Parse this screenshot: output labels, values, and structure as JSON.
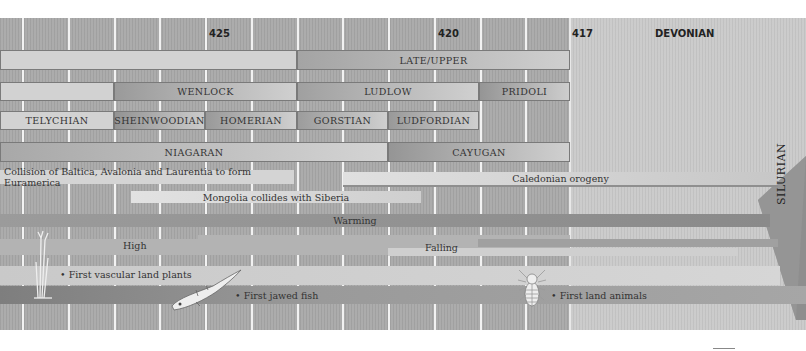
{
  "axis": {
    "ticks": [
      {
        "label": "425",
        "x": 209
      },
      {
        "label": "420",
        "x": 438
      },
      {
        "label": "417",
        "x": 572
      }
    ],
    "gridlines_x": [
      22,
      68,
      114,
      159,
      205,
      251,
      297,
      342,
      388,
      434,
      480,
      525,
      570
    ]
  },
  "periods": {
    "next": "DEVONIAN",
    "current": "SILURIAN"
  },
  "epochs_row1": [
    {
      "label": "",
      "x": 0,
      "w": 297,
      "tone": "light"
    },
    {
      "label": "LATE/UPPER",
      "x": 297,
      "w": 273,
      "tone": "mid"
    }
  ],
  "epochs_row2": [
    {
      "label": "",
      "x": 0,
      "w": 114,
      "tone": "light"
    },
    {
      "label": "WENLOCK",
      "x": 114,
      "w": 183,
      "tone": "mid"
    },
    {
      "label": "LUDLOW",
      "x": 297,
      "w": 182,
      "tone": "mid"
    },
    {
      "label": "PRIDOLI",
      "x": 479,
      "w": 91,
      "tone": "dark"
    }
  ],
  "stages": [
    {
      "label": "TELYCHIAN",
      "x": 0,
      "w": 114,
      "tone": "light"
    },
    {
      "label": "SHEINWOODIAN",
      "x": 114,
      "w": 91,
      "tone": "dark"
    },
    {
      "label": "HOMERIAN",
      "x": 205,
      "w": 92,
      "tone": "mid"
    },
    {
      "label": "GORSTIAN",
      "x": 297,
      "w": 91,
      "tone": "mid"
    },
    {
      "label": "LUDFORDIAN",
      "x": 388,
      "w": 91,
      "tone": "dark"
    }
  ],
  "series_na": [
    {
      "label": "NIAGARAN",
      "x": 0,
      "w": 388,
      "tone": "light"
    },
    {
      "label": "CAYUGAN",
      "x": 388,
      "w": 182,
      "tone": "dark"
    }
  ],
  "events": {
    "collision": "Collision of Baltica, Avalonia and Laurentia to form Euramerica",
    "caledonian": "Caledonian orogeny",
    "mongolia": "Mongolia collides with Siberia",
    "climate": "Warming",
    "sea_level_high": "High",
    "sea_level_falling": "Falling",
    "plants": "First vascular land plants",
    "fish": "First jawed fish",
    "animals": "First land animals"
  },
  "illustrations": {
    "plant": "plant-illustration",
    "fish": "jawed-fish-illustration",
    "arthropod": "land-animal-illustration"
  },
  "colors": {
    "background": "#a9a9a9",
    "devonian_bg": "#c9c9c9",
    "light_band": "#d2d2d2",
    "dark_band": "#8f8f8f",
    "gridline": "#f2f2f2"
  }
}
